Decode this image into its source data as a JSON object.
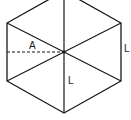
{
  "diagram": {
    "shape": "regular hexagon divided into six equilateral triangles",
    "stroke_color": "#1a1a1a",
    "background_color": "#ffffff",
    "labels": {
      "apothem": "A",
      "side": "L",
      "radius": "L"
    },
    "elements": [
      {
        "type": "outline",
        "description": "hexagon perimeter"
      },
      {
        "type": "spoke",
        "description": "lines from center to each vertex"
      },
      {
        "type": "dashed-line",
        "description": "apothem from center to left side midpoint",
        "label": "A"
      },
      {
        "type": "side-label",
        "description": "right side length",
        "label": "L"
      },
      {
        "type": "radius-label",
        "description": "center to bottom vertex",
        "label": "L"
      }
    ]
  }
}
